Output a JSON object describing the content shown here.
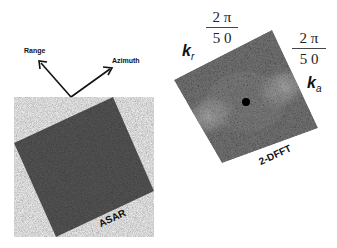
{
  "axes": {
    "range_label": "Range",
    "azimuth_label": "Azimuth"
  },
  "asar_panel": {
    "caption": "ASAR",
    "fill_color": "#555555"
  },
  "fft_panel": {
    "caption": "2-DFFT",
    "kr_symbol": "k",
    "kr_sub": "r",
    "ka_symbol": "k",
    "ka_sub": "a",
    "kr_fraction": {
      "numerator": "2 π",
      "denominator": "5 0"
    },
    "ka_fraction": {
      "numerator": "2 π",
      "denominator": "5 0"
    }
  }
}
